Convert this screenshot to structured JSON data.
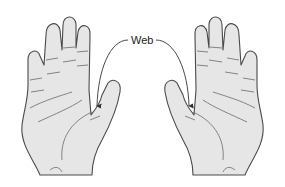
{
  "figure": {
    "label": "Web",
    "colors": {
      "skin_fill": "#e6e6e6",
      "outline": "#4a4a4a",
      "crease": "#6a6a6a",
      "background": "#ffffff"
    },
    "hands": [
      {
        "side": "left-image",
        "description": "right hand palm view, thumb on right"
      },
      {
        "side": "right-image",
        "description": "left hand palm view, thumb on left"
      }
    ],
    "arrows": [
      {
        "from": "label",
        "to": "left hand thumb web"
      },
      {
        "from": "label",
        "to": "right hand thumb web"
      }
    ]
  }
}
